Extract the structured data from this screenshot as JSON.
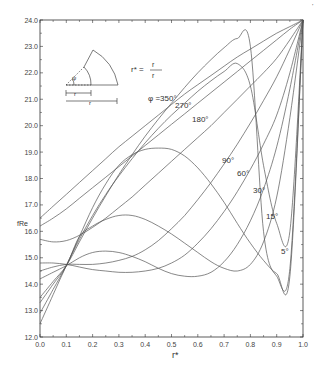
{
  "chart_data": {
    "type": "line",
    "title": "",
    "xlabel": "r*",
    "ylabel": "fRe",
    "xlim": [
      0.0,
      1.0
    ],
    "ylim": [
      12.0,
      24.0
    ],
    "x_ticks": [
      "0.0",
      "0.1",
      "0.2",
      "0.3",
      "0.4",
      "0.5",
      "0.6",
      "0.7",
      "0.8",
      "0.9",
      "1.0"
    ],
    "y_ticks": [
      "12.0",
      "13.0",
      "14.0",
      "15.0",
      "16.0",
      "17.0",
      "18.0",
      "19.0",
      "20.0",
      "21.0",
      "22.0",
      "23.0",
      "24.0"
    ],
    "grid": false,
    "legend": "inline labels",
    "annotation_formula": "r* = r_i / r_o",
    "inset": {
      "labels": [
        "ψ",
        "r_i",
        "r_o"
      ],
      "description": "annular sector of angle ψ with inner radius r_i and outer radius r_o"
    },
    "x": [
      0.0,
      0.05,
      0.1,
      0.15,
      0.2,
      0.25,
      0.3,
      0.35,
      0.4,
      0.45,
      0.5,
      0.55,
      0.6,
      0.65,
      0.7,
      0.75,
      0.8,
      0.85,
      0.9,
      0.95,
      1.0
    ],
    "series": [
      {
        "name": "φ = 350°",
        "label": "φ =350°",
        "values": [
          16.5,
          16.95,
          17.4,
          17.85,
          18.3,
          18.75,
          19.2,
          19.6,
          20.0,
          20.4,
          20.8,
          21.2,
          21.55,
          21.9,
          22.25,
          22.6,
          22.9,
          23.2,
          23.5,
          23.75,
          24.0
        ]
      },
      {
        "name": "270°",
        "label": "270°",
        "values": [
          16.2,
          16.5,
          16.85,
          17.25,
          17.65,
          18.05,
          18.45,
          18.85,
          19.25,
          19.65,
          20.05,
          20.45,
          20.85,
          21.25,
          21.65,
          22.05,
          22.45,
          22.85,
          23.25,
          23.65,
          24.0
        ]
      },
      {
        "name": "180°",
        "label": "180°",
        "values": [
          15.7,
          15.6,
          15.65,
          15.85,
          16.15,
          16.5,
          16.9,
          17.3,
          17.75,
          18.2,
          18.65,
          19.1,
          19.55,
          20.0,
          20.5,
          21.0,
          21.5,
          22.0,
          22.55,
          23.25,
          24.0
        ]
      },
      {
        "name": "135° (unlabeled)",
        "label": "",
        "values": [
          12.9,
          13.8,
          14.7,
          15.8,
          16.9,
          17.8,
          18.5,
          18.9,
          19.1,
          19.15,
          19.1,
          18.85,
          18.4,
          17.8,
          17.1,
          16.3,
          15.55,
          14.9,
          14.4,
          14.3,
          24.0
        ]
      },
      {
        "name": "90°",
        "label": "90°",
        "values": [
          14.5,
          14.65,
          14.75,
          14.75,
          14.75,
          14.8,
          14.9,
          15.05,
          15.3,
          15.65,
          16.1,
          16.6,
          17.2,
          17.85,
          18.55,
          19.3,
          20.1,
          20.95,
          21.85,
          22.9,
          24.0
        ]
      },
      {
        "name": "60°",
        "label": "60°",
        "values": [
          14.8,
          14.8,
          14.75,
          14.65,
          14.55,
          14.5,
          14.45,
          14.45,
          14.5,
          14.6,
          14.8,
          15.1,
          15.55,
          16.1,
          16.75,
          17.5,
          18.35,
          19.3,
          20.4,
          22.0,
          24.0
        ]
      },
      {
        "name": "45° (unlabeled)",
        "label": "",
        "values": [
          13.3,
          14.0,
          14.7,
          15.8,
          16.2,
          16.45,
          16.6,
          16.6,
          16.45,
          16.2,
          15.9,
          15.55,
          15.2,
          14.85,
          14.6,
          14.5,
          14.75,
          15.6,
          17.3,
          20.3,
          24.0
        ]
      },
      {
        "name": "30°",
        "label": "30°",
        "values": [
          14.2,
          14.45,
          14.7,
          15.0,
          15.2,
          15.25,
          15.2,
          15.05,
          14.85,
          14.6,
          14.4,
          14.3,
          14.3,
          14.45,
          14.85,
          15.5,
          16.4,
          17.6,
          19.2,
          21.4,
          24.0
        ]
      },
      {
        "name": "15°",
        "label": "15°",
        "values": [
          12.5,
          13.6,
          14.7,
          15.7,
          16.6,
          17.4,
          18.1,
          18.75,
          19.35,
          19.9,
          20.4,
          20.85,
          21.3,
          21.7,
          22.05,
          22.35,
          21.5,
          18.5,
          16.3,
          16.0,
          24.0
        ]
      },
      {
        "name": "5°",
        "label": "5°",
        "values": [
          13.5,
          14.1,
          14.7,
          15.6,
          16.5,
          17.35,
          18.15,
          18.9,
          19.6,
          20.25,
          20.85,
          21.45,
          22.0,
          22.5,
          22.95,
          23.3,
          23.0,
          16.0,
          14.3,
          14.6,
          24.0
        ]
      }
    ]
  },
  "page": {
    "page_mark": "’",
    "caption_fragment": "Fig. — fRe vs r* for annular sector ducts"
  }
}
